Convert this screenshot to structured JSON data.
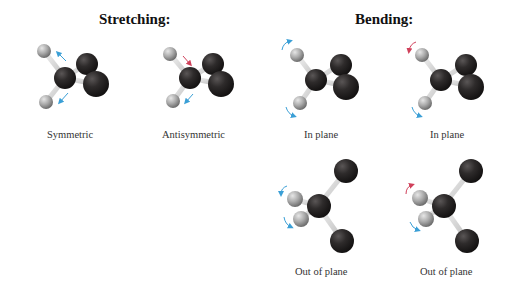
{
  "titles": {
    "stretching": "Stretching:",
    "bending": "Bending:"
  },
  "labels": {
    "symmetric": "Symmetric",
    "antisymmetric": "Antisymmetric",
    "in_plane_1": "In plane",
    "in_plane_2": "In plane",
    "out_of_plane_1": "Out of plane",
    "out_of_plane_2": "Out of plane"
  },
  "colors": {
    "carbon_oxygen": "#2a2828",
    "hydrogen": "#a8a8a8",
    "bond": "#d8d8d8",
    "arrow_blue": "#3a9fd6",
    "arrow_red": "#d0405a"
  },
  "modes": [
    {
      "group": "Stretching",
      "name": "Symmetric",
      "arrows": [
        "blue",
        "blue"
      ]
    },
    {
      "group": "Stretching",
      "name": "Antisymmetric",
      "arrows": [
        "red",
        "blue"
      ]
    },
    {
      "group": "Bending",
      "name": "In plane",
      "arrows": [
        "blue",
        "blue"
      ]
    },
    {
      "group": "Bending",
      "name": "In plane",
      "arrows": [
        "red",
        "blue"
      ]
    },
    {
      "group": "Bending",
      "name": "Out of plane",
      "arrows": [
        "blue",
        "blue"
      ]
    },
    {
      "group": "Bending",
      "name": "Out of plane",
      "arrows": [
        "red",
        "blue"
      ]
    }
  ]
}
